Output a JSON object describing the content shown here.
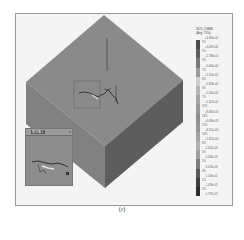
{
  "figure": {
    "caption": "(c)"
  },
  "legend": {
    "header_line1": "SDV_CNBM",
    "header_line2": "(Avg: 75%)",
    "bands": [
      {
        "pct": "5%",
        "color": "#4a4a4a"
      },
      {
        "pct": "5%",
        "color": "#5f5f5f"
      },
      {
        "pct": "5%",
        "color": "#7a7a7a"
      },
      {
        "pct": "7%",
        "color": "#9c9c9c"
      },
      {
        "pct": "6%",
        "color": "#cfcfcf"
      },
      {
        "pct": "6%",
        "color": "#b7b7b7"
      },
      {
        "pct": "7%",
        "color": "#a6a6a6"
      },
      {
        "pct": "11%",
        "color": "#9a9a9a"
      },
      {
        "pct": "13%",
        "color": "#8e8e8e"
      },
      {
        "pct": "12%",
        "color": "#959595"
      },
      {
        "pct": "10%",
        "color": "#a3a3a3"
      },
      {
        "pct": "8%",
        "color": "#b2b2b2"
      },
      {
        "pct": "5%",
        "color": "#a0a0a0"
      },
      {
        "pct": "5%",
        "color": "#7d7d7d"
      },
      {
        "pct": "3%",
        "color": "#5a5a5a"
      },
      {
        "pct": "2%",
        "color": "#3e3e3e"
      },
      {
        "pct": "2%",
        "color": "#2c2c2c"
      }
    ],
    "values": [
      "+3.335e-02",
      "+3.037e-02",
      "+2.738e-02",
      "+2.440e-02",
      "+2.142e-02",
      "+1.843e-02",
      "+1.545e-02",
      "+1.247e-02",
      "+9.482e-03",
      "+6.498e-03",
      "+3.515e-03",
      "+5.312e-04",
      "-2.452e-03",
      "-5.436e-03",
      "-8.419e-03",
      "-1.140e-02",
      "-1.439e-02",
      "-1.737e-02"
    ]
  },
  "inset": {
    "title": "放大图 1",
    "close_icon": "×"
  },
  "colors": {
    "top_face": "#8a8a8a",
    "left_face": "#808080",
    "right_face": "#5e5e5e",
    "background": "#f4f4f4"
  }
}
